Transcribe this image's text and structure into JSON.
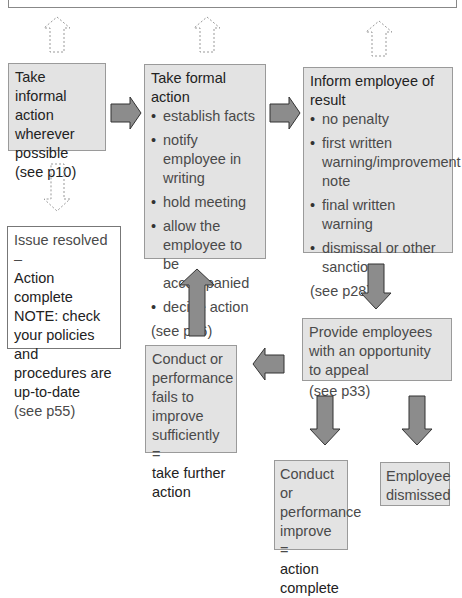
{
  "diagram": {
    "top_box": {
      "text": ""
    },
    "informal": {
      "title": "Take informal action wherever possible",
      "ref": "(see p10)"
    },
    "formal": {
      "title": "Take formal action",
      "items": [
        "establish facts",
        "notify employee in writing",
        "hold meeting",
        "allow the employee to be accompanied",
        "decide action"
      ],
      "ref": "(see p16)"
    },
    "inform": {
      "title": "Inform employee of result",
      "items": [
        "no penalty",
        "first written warning/improvement note",
        "final written warning",
        "dismissal or other sanction"
      ],
      "ref": "(see p28)"
    },
    "resolved": {
      "line1": "Issue resolved –",
      "line2": "Action complete",
      "note": "NOTE: check your policies and procedures are up-to-date",
      "ref": "(see p55)"
    },
    "fails": {
      "text": "Conduct or performance fails to improve sufficiently =",
      "emph": "take further action"
    },
    "appeal": {
      "text": "Provide employees with an opportunity to appeal",
      "ref": "(see p33)"
    },
    "improve": {
      "text": "Conduct or performance improve =",
      "emph": "action complete"
    },
    "dismissed": {
      "text": "Employee dismissed"
    },
    "colors": {
      "box_fill": "#e3e3e3",
      "arrow_fill": "#8c8c8c",
      "border": "#9a9a9a"
    }
  }
}
